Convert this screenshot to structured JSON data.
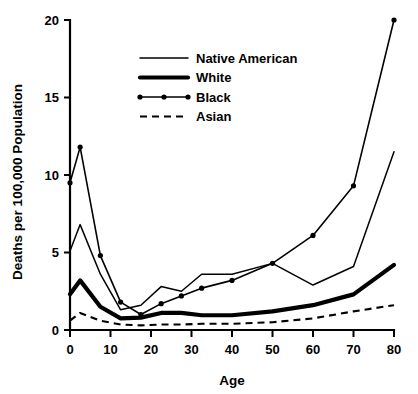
{
  "chart_data": {
    "type": "line",
    "title": "",
    "xlabel": "Age",
    "ylabel": "Deaths per 100,000 Population",
    "xlim": [
      0,
      80
    ],
    "ylim": [
      0,
      20
    ],
    "xticks": [
      0,
      10,
      20,
      30,
      40,
      50,
      60,
      70,
      80
    ],
    "yticks": [
      0,
      5,
      10,
      15,
      20
    ],
    "grid": false,
    "legend_position": "upper-center",
    "series": [
      {
        "name": "Native American",
        "style": "thin-solid",
        "markers": false,
        "x": [
          0,
          2.5,
          7.5,
          12.5,
          17.5,
          22.5,
          27.5,
          32.5,
          40,
          50,
          60,
          70,
          80
        ],
        "values": [
          5.1,
          6.8,
          3.6,
          1.3,
          1.6,
          2.8,
          2.5,
          3.6,
          3.6,
          4.3,
          2.9,
          4.1,
          11.5
        ]
      },
      {
        "name": "White",
        "style": "thick-solid",
        "markers": false,
        "x": [
          0,
          2.5,
          7.5,
          12.5,
          17.5,
          22.5,
          27.5,
          32.5,
          40,
          50,
          60,
          70,
          80
        ],
        "values": [
          2.3,
          3.2,
          1.5,
          0.75,
          0.8,
          1.1,
          1.1,
          0.95,
          0.95,
          1.2,
          1.6,
          2.3,
          4.2
        ]
      },
      {
        "name": "Black",
        "style": "thin-solid-markers",
        "markers": true,
        "x": [
          0,
          2.5,
          7.5,
          12.5,
          17.5,
          22.5,
          27.5,
          32.5,
          40,
          50,
          60,
          70,
          80
        ],
        "values": [
          9.5,
          11.8,
          4.8,
          1.8,
          1.0,
          1.7,
          2.2,
          2.7,
          3.2,
          4.3,
          6.1,
          9.3,
          20.0
        ]
      },
      {
        "name": "Asian",
        "style": "dashed",
        "markers": false,
        "x": [
          0,
          2.5,
          7.5,
          12.5,
          17.5,
          22.5,
          27.5,
          32.5,
          40,
          50,
          60,
          70,
          80
        ],
        "values": [
          0.6,
          1.1,
          0.6,
          0.35,
          0.3,
          0.35,
          0.35,
          0.4,
          0.4,
          0.5,
          0.75,
          1.2,
          1.6
        ]
      }
    ]
  },
  "legend": {
    "entries": [
      {
        "label": "Native American"
      },
      {
        "label": "White"
      },
      {
        "label": "Black"
      },
      {
        "label": "Asian"
      }
    ]
  },
  "axes": {
    "x_title": "Age",
    "y_title": "Deaths per 100,000 Population",
    "x_tick_labels": [
      "0",
      "10",
      "20",
      "30",
      "40",
      "50",
      "60",
      "70",
      "80"
    ],
    "y_tick_labels": [
      "0",
      "5",
      "10",
      "15",
      "20"
    ]
  },
  "colors": {
    "foreground": "#000000",
    "background": "#ffffff"
  }
}
